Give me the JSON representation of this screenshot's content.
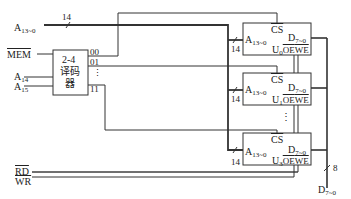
{
  "inputs": {
    "address_low": {
      "name": "A",
      "sub": "13~0",
      "bus_width": "14"
    },
    "mem": "MEM",
    "a14": {
      "name": "A",
      "sub": "14"
    },
    "a15": {
      "name": "A",
      "sub": "15"
    },
    "rd": "RD",
    "wr": "WR"
  },
  "decoder": {
    "line1": "2-4",
    "line2": "译码",
    "line3": "器",
    "outputs": [
      "00",
      "01",
      "⋮",
      "11"
    ]
  },
  "chips": [
    {
      "id": "U",
      "sub": "0",
      "cs": "CS",
      "addr": "A",
      "addr_sub": "13~0",
      "data": "D",
      "data_sub": "7~0",
      "oe": "OE",
      "we": "WE",
      "bus_width": "14"
    },
    {
      "id": "U",
      "sub": "1",
      "cs": "CS",
      "addr": "A",
      "addr_sub": "13~0",
      "data": "D",
      "data_sub": "7~0",
      "oe": "OE",
      "we": "WE",
      "bus_width": "14"
    },
    {
      "id": "U",
      "sub": "3",
      "cs": "CS",
      "addr": "A",
      "addr_sub": "13~0",
      "data": "D",
      "data_sub": "7~0",
      "oe": "OE",
      "we": "WE",
      "bus_width": "14"
    }
  ],
  "ellipsis": "⋮",
  "data_bus": {
    "name": "D",
    "sub": "7~0",
    "width": "8"
  }
}
